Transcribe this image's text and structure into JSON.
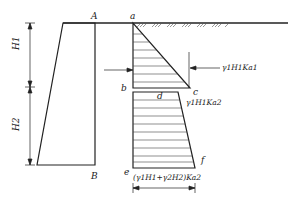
{
  "diagram": {
    "type": "earth-pressure-distribution-layered-soil",
    "points": {
      "A": "A",
      "B": "B",
      "a": "a",
      "b": "b",
      "c": "c",
      "d": "d",
      "e": "e",
      "f": "f"
    },
    "dimensions": {
      "H1": "H1",
      "H2": "H2"
    },
    "annotations": {
      "pressure_c": "γ1H1Ka1",
      "pressure_d": "γ1H1Ka2",
      "pressure_f": "(γ1H1+γ2H2)Ka2"
    },
    "colors": {
      "line": "#222222",
      "background": "#ffffff"
    }
  }
}
